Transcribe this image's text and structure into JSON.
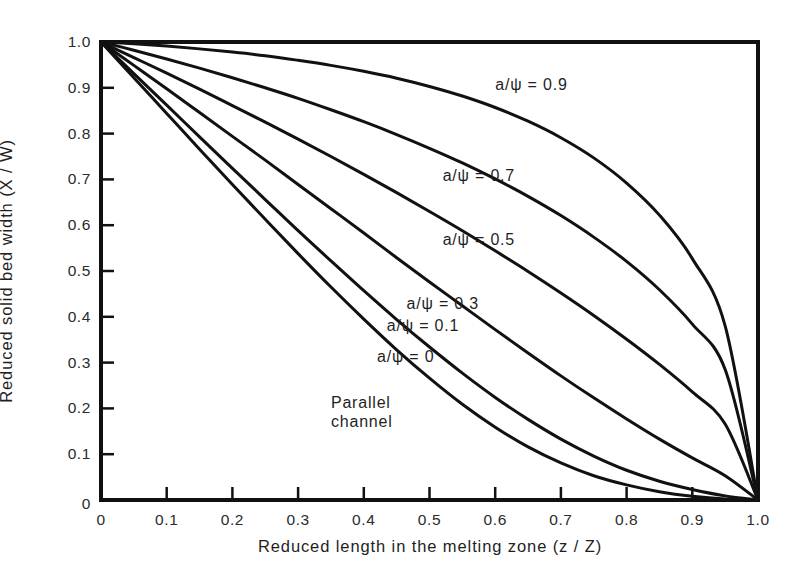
{
  "chart_data": {
    "type": "line",
    "title": "",
    "xlabel": "Reduced length in the melting zone (z / Z)",
    "ylabel": "Reduced solid bed width (X / W)",
    "xlim": [
      0,
      1.0
    ],
    "ylim": [
      0,
      1.0
    ],
    "grid": false,
    "legend_position": "inline-curve-labels",
    "xticks": [
      "0",
      "0.1",
      "0.2",
      "0.3",
      "0.4",
      "0.5",
      "0.6",
      "0.7",
      "0.8",
      "0.9",
      "1.0"
    ],
    "xtick_values": [
      0,
      0.1,
      0.2,
      0.3,
      0.4,
      0.5,
      0.6,
      0.7,
      0.8,
      0.9,
      1.0
    ],
    "yticks": [
      "0",
      "0.1",
      "0.2",
      "0.3",
      "0.4",
      "0.5",
      "0.6",
      "0.7",
      "0.8",
      "0.9",
      "1.0"
    ],
    "ytick_values": [
      0,
      0.1,
      0.2,
      0.3,
      0.4,
      0.5,
      0.6,
      0.7,
      0.8,
      0.9,
      1.0
    ],
    "x": [
      0,
      0.05,
      0.1,
      0.15,
      0.2,
      0.25,
      0.3,
      0.35,
      0.4,
      0.45,
      0.5,
      0.55,
      0.6,
      0.65,
      0.7,
      0.75,
      0.8,
      0.85,
      0.9,
      0.95,
      1.0
    ],
    "series": [
      {
        "name": "a/ψ = 0.9",
        "label": "a/ψ = 0.9",
        "values": [
          1.0,
          0.996,
          0.991,
          0.985,
          0.978,
          0.97,
          0.96,
          0.949,
          0.936,
          0.921,
          0.903,
          0.882,
          0.857,
          0.827,
          0.791,
          0.747,
          0.692,
          0.622,
          0.527,
          0.38,
          0.0
        ],
        "label_x": 0.6,
        "label_y": 0.905
      },
      {
        "name": "a/ψ = 0.7",
        "label": "a/ψ = 0.7",
        "values": [
          1.0,
          0.982,
          0.963,
          0.943,
          0.922,
          0.9,
          0.877,
          0.852,
          0.826,
          0.798,
          0.768,
          0.736,
          0.701,
          0.663,
          0.621,
          0.574,
          0.521,
          0.459,
          0.384,
          0.285,
          0.0
        ],
        "label_x": 0.52,
        "label_y": 0.705
      },
      {
        "name": "a/ψ = 0.5",
        "label": "a/ψ = 0.5",
        "values": [
          1.0,
          0.966,
          0.932,
          0.897,
          0.861,
          0.825,
          0.788,
          0.75,
          0.711,
          0.671,
          0.63,
          0.588,
          0.544,
          0.499,
          0.452,
          0.403,
          0.351,
          0.296,
          0.236,
          0.166,
          0.0
        ],
        "label_x": 0.52,
        "label_y": 0.565
      },
      {
        "name": "a/ψ = 0.3",
        "label": "a/ψ = 0.3",
        "values": [
          1.0,
          0.949,
          0.898,
          0.846,
          0.794,
          0.742,
          0.689,
          0.636,
          0.583,
          0.529,
          0.476,
          0.424,
          0.372,
          0.321,
          0.271,
          0.223,
          0.177,
          0.133,
          0.092,
          0.053,
          0.0
        ],
        "label_x": 0.465,
        "label_y": 0.425
      },
      {
        "name": "a/ψ = 0.1",
        "label": "a/ψ = 0.1",
        "values": [
          1.0,
          0.931,
          0.862,
          0.793,
          0.724,
          0.656,
          0.588,
          0.522,
          0.457,
          0.394,
          0.334,
          0.277,
          0.224,
          0.176,
          0.133,
          0.096,
          0.065,
          0.041,
          0.023,
          0.009,
          0.0
        ],
        "label_x": 0.435,
        "label_y": 0.377
      },
      {
        "name": "a/ψ = 0",
        "label": "a/ψ = 0",
        "values": [
          1.0,
          0.922,
          0.844,
          0.766,
          0.689,
          0.613,
          0.538,
          0.465,
          0.395,
          0.328,
          0.266,
          0.209,
          0.159,
          0.116,
          0.081,
          0.053,
          0.033,
          0.018,
          0.008,
          0.002,
          0.0
        ],
        "label_x": 0.42,
        "label_y": 0.31
      }
    ],
    "annotations": [
      {
        "name": "parallel-channel",
        "line1": "Parallel",
        "line2": "channel",
        "x": 0.35,
        "y": 0.21
      }
    ]
  },
  "axes": {
    "x_title": "Reduced length in the melting zone (z / Z)",
    "y_title": "Reduced solid bed width (X / W)"
  }
}
